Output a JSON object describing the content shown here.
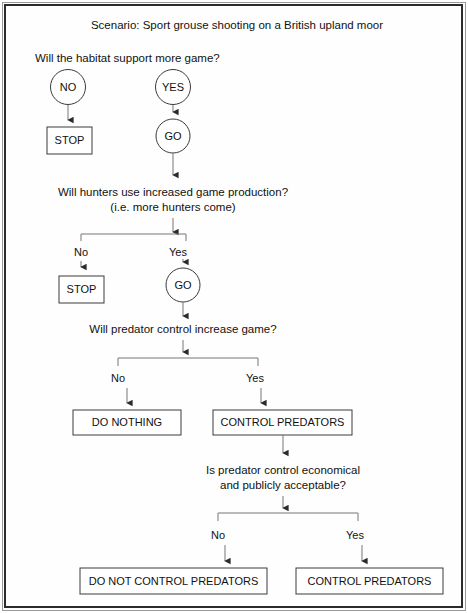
{
  "figure": {
    "title": "Scenario: Sport  grouse shooting on a British upland moor",
    "border_color": "#2b2b2b",
    "shape_stroke": "#3a3a3a",
    "text_color": "#111111",
    "background": "#fefefe"
  },
  "questions": {
    "q1": "Will the habitat support more game?",
    "q2_line1": "Will hunters use increased game production?",
    "q2_line2": "(i.e. more hunters come)",
    "q3": "Will predator control increase game?",
    "q4_line1": "Is predator control economical",
    "q4_line2": "and publicly acceptable?"
  },
  "nodes": {
    "no_circle": "NO",
    "yes_circle": "YES",
    "go_circle_1": "GO",
    "go_circle_2": "GO",
    "stop_box_1": "STOP",
    "stop_box_2": "STOP",
    "do_nothing_box": "DO NOTHING",
    "control_predators_box_1": "CONTROL PREDATORS",
    "do_not_control_predators_box": "DO NOT CONTROL PREDATORS",
    "control_predators_box_2": "CONTROL PREDATORS"
  },
  "branch_labels": {
    "b2_no": "No",
    "b2_yes": "Yes",
    "b3_no": "No",
    "b3_yes": "Yes",
    "b4_no": "No",
    "b4_yes": "Yes"
  },
  "icons": {
    "arrow": "arrow-down-icon"
  }
}
